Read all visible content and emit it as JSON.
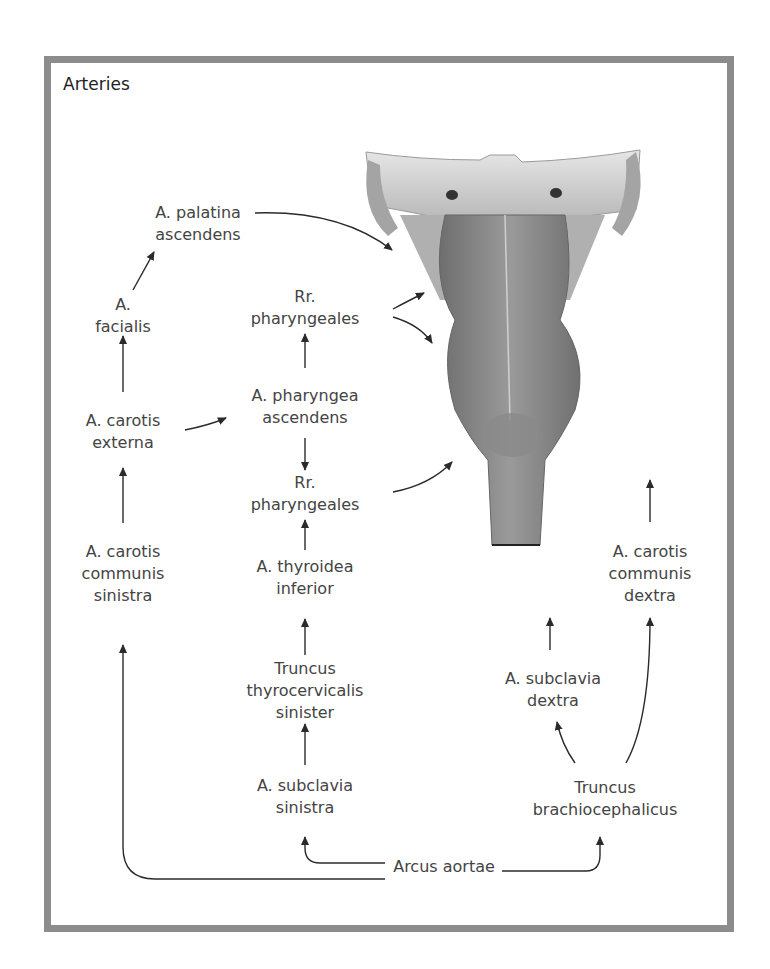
{
  "figure": {
    "title": "Arteries",
    "labels": {
      "palatina": [
        "A. palatina",
        "ascendens"
      ],
      "facialis": [
        "A.",
        "facialis"
      ],
      "rr_pharyngeales_upper": [
        "Rr.",
        "pharyngeales"
      ],
      "carotis_externa": [
        "A. carotis",
        "externa"
      ],
      "pharyngea_ascendens": [
        "A. pharyngea",
        "ascendens"
      ],
      "rr_pharyngeales_lower": [
        "Rr.",
        "pharyngeales"
      ],
      "carotis_communis_sinistra": [
        "A. carotis",
        "communis",
        "sinistra"
      ],
      "thyroidea_inferior": [
        "A. thyroidea",
        "inferior"
      ],
      "truncus_thyrocervicalis": [
        "Truncus",
        "thyrocervicalis",
        "sinister"
      ],
      "subclavia_sinistra": [
        "A. subclavia",
        "sinistra"
      ],
      "carotis_communis_dextra": [
        "A. carotis",
        "communis",
        "dextra"
      ],
      "subclavia_dextra": [
        "A. subclavia",
        "dextra"
      ],
      "truncus_brachiocephalicus": [
        "Truncus",
        "brachiocephalicus"
      ],
      "arcus_aortae": [
        "Arcus aortae"
      ]
    },
    "illustration": "pharynx-posterior-view",
    "colors": {
      "border": "#8c8c8c",
      "arrow": "#2a2a2a",
      "text": "#444444"
    }
  }
}
